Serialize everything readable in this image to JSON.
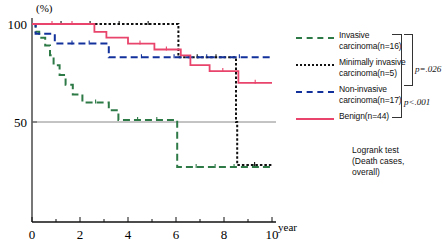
{
  "chart_data": {
    "type": "line",
    "plot_kind": "kaplan-meier-survival",
    "title": "",
    "xlabel": "year",
    "ylabel": "(%)",
    "xlim": [
      0,
      10
    ],
    "ylim": [
      0,
      105
    ],
    "x_ticks": [
      0,
      1,
      2,
      3,
      4,
      5,
      6,
      7,
      8,
      9,
      10
    ],
    "x_tick_labels": [
      "0",
      "",
      "2",
      "",
      "4",
      "",
      "6",
      "",
      "8",
      "",
      "10"
    ],
    "y_ticks": [
      50,
      100
    ],
    "y_tick_labels": [
      "50",
      "100"
    ],
    "grid": false,
    "reference_line_y": 50,
    "legend_position": "right",
    "series": [
      {
        "name": "Invasive carcinoma(n=16)",
        "color": "#2e7a47",
        "style": "dashed",
        "steps": [
          [
            0.0,
            100
          ],
          [
            0.15,
            96
          ],
          [
            0.3,
            93
          ],
          [
            0.55,
            89
          ],
          [
            0.75,
            84
          ],
          [
            0.9,
            79
          ],
          [
            1.15,
            74
          ],
          [
            1.4,
            69
          ],
          [
            1.7,
            64
          ],
          [
            2.1,
            60
          ],
          [
            3.2,
            56
          ],
          [
            3.6,
            51
          ],
          [
            6.0,
            51
          ],
          [
            6.05,
            27
          ],
          [
            10.0,
            27
          ]
        ]
      },
      {
        "name": "Minimally invasive carcinoma(n=5)",
        "color": "#111111",
        "style": "dotted",
        "steps": [
          [
            0.0,
            100
          ],
          [
            6.05,
            100
          ],
          [
            6.1,
            83
          ],
          [
            8.45,
            83
          ],
          [
            8.5,
            50
          ],
          [
            8.55,
            28
          ],
          [
            10.0,
            28
          ]
        ]
      },
      {
        "name": "Non-invasive carcinoma(n=17)",
        "color": "#13319b",
        "style": "dashed",
        "steps": [
          [
            0.0,
            100
          ],
          [
            0.15,
            95
          ],
          [
            0.9,
            95
          ],
          [
            0.95,
            90
          ],
          [
            3.1,
            90
          ],
          [
            3.2,
            83
          ],
          [
            10.0,
            83
          ]
        ]
      },
      {
        "name": "Benign(n=44)",
        "color": "#e8446c",
        "style": "solid",
        "steps": [
          [
            0.0,
            100
          ],
          [
            2.5,
            100
          ],
          [
            2.6,
            96
          ],
          [
            3.0,
            96
          ],
          [
            3.1,
            93
          ],
          [
            3.9,
            93
          ],
          [
            4.0,
            90
          ],
          [
            5.0,
            90
          ],
          [
            5.1,
            87
          ],
          [
            6.1,
            87
          ],
          [
            6.2,
            84
          ],
          [
            6.5,
            84
          ],
          [
            6.6,
            79
          ],
          [
            7.3,
            79
          ],
          [
            7.4,
            76
          ],
          [
            8.5,
            76
          ],
          [
            8.6,
            70
          ],
          [
            10.0,
            70
          ]
        ]
      }
    ],
    "annotations": [
      {
        "text": "p=.026",
        "group": "upper-bracket"
      },
      {
        "text": "p<.001",
        "group": "lower-bracket"
      },
      {
        "text": "Logrank test",
        "group": "note"
      },
      {
        "text": "(Death cases,",
        "group": "note"
      },
      {
        "text": "overall)",
        "group": "note"
      }
    ]
  },
  "axes": {
    "y_unit": "(%)",
    "y_label_100": "100",
    "y_label_50": "50",
    "x_label_0": "0",
    "x_label_2": "2",
    "x_label_4": "4",
    "x_label_6": "6",
    "x_label_8": "8",
    "x_label_10": "10",
    "x_unit": "year"
  },
  "legend": {
    "items": [
      {
        "key": "green-dashed-key",
        "line1": "Invasive",
        "line2": "carcinoma(n=16)"
      },
      {
        "key": "black-dotted-key",
        "line1": "Minimally invasive",
        "line2": "carcinoma(n=5)"
      },
      {
        "key": "blue-dashed-key",
        "line1": "Non-invasive",
        "line2": "carcinoma(n=17)"
      },
      {
        "key": "pink-solid-key",
        "line1": "Benign(n=44)",
        "line2": ""
      }
    ]
  },
  "stats": {
    "p_upper": "p=.026",
    "p_lower": "p<.001",
    "note_line1": "Logrank test",
    "note_line2": "(Death cases,",
    "note_line3": " overall)"
  }
}
